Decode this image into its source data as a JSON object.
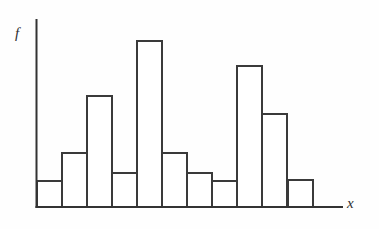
{
  "figure": {
    "kind": "histogram-figure",
    "background_color": "#fdfdfd",
    "line_color": "#3a3a3a",
    "axis_color": "#333333",
    "bar_fill": "#ffffff"
  },
  "axes": {
    "y_label": "f",
    "x_label": "x",
    "y_axis_x": 36.5,
    "y_axis_top": 20,
    "baseline_y": 207,
    "x_axis_start": 36.5,
    "x_axis_end": 342,
    "bar_left_start": 37,
    "bar_width": 25
  },
  "chart_data": {
    "type": "bar",
    "title": "",
    "subtitle": "",
    "xlabel": "x",
    "ylabel": "f",
    "grid": false,
    "legend": null,
    "axis_ticks_shown": false,
    "tick_labels_x": [],
    "tick_labels_y": [],
    "categories": [
      "1",
      "2",
      "3",
      "4",
      "5",
      "6",
      "7",
      "8",
      "9",
      "10",
      "11"
    ],
    "values": [
      26,
      54,
      111,
      34,
      166,
      54,
      34,
      26,
      141,
      93,
      27
    ],
    "top_pixel_y": [
      181,
      153,
      96,
      173,
      41,
      153,
      173,
      181,
      66,
      114,
      180
    ],
    "ylim": [
      0,
      187
    ],
    "xlim": [
      0,
      11
    ],
    "bar_count": 11
  },
  "bars": [
    {
      "index": 1,
      "value": 26,
      "top_y": 181,
      "left_x": 37,
      "width": 25
    },
    {
      "index": 2,
      "value": 54,
      "top_y": 153,
      "left_x": 62,
      "width": 25
    },
    {
      "index": 3,
      "value": 111,
      "top_y": 96,
      "left_x": 87,
      "width": 25
    },
    {
      "index": 4,
      "value": 34,
      "top_y": 173,
      "left_x": 112,
      "width": 25
    },
    {
      "index": 5,
      "value": 166,
      "top_y": 41,
      "left_x": 137,
      "width": 25
    },
    {
      "index": 6,
      "value": 54,
      "top_y": 153,
      "left_x": 162,
      "width": 25
    },
    {
      "index": 7,
      "value": 34,
      "top_y": 173,
      "left_x": 187,
      "width": 25
    },
    {
      "index": 8,
      "value": 26,
      "top_y": 181,
      "left_x": 212,
      "width": 25
    },
    {
      "index": 9,
      "value": 141,
      "top_y": 66,
      "left_x": 237,
      "width": 25
    },
    {
      "index": 10,
      "value": 93,
      "top_y": 114,
      "left_x": 262,
      "width": 25
    },
    {
      "index": 11,
      "value": 27,
      "top_y": 180,
      "left_x": 288,
      "width": 25
    }
  ]
}
